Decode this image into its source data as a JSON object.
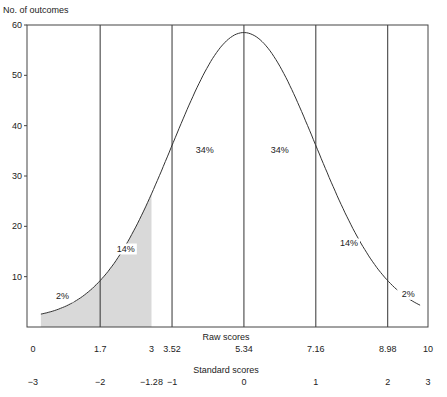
{
  "chart_data": {
    "type": "area",
    "title": "",
    "ylabel": "No. of outcomes",
    "xlabel_raw": "Raw scores",
    "xlabel_std": "Standard scores",
    "ylim": [
      0,
      60
    ],
    "yticks": [
      10,
      20,
      30,
      40,
      50,
      60
    ],
    "xlim": [
      0,
      10
    ],
    "raw_ticks": [
      {
        "value": 0,
        "label": "0"
      },
      {
        "value": 1.7,
        "label": "1.7"
      },
      {
        "value": 3,
        "label": "3"
      },
      {
        "value": 3.52,
        "label": "3.52"
      },
      {
        "value": 5.34,
        "label": "5.34"
      },
      {
        "value": 7.16,
        "label": "7.16"
      },
      {
        "value": 8.98,
        "label": "8.98"
      },
      {
        "value": 10,
        "label": "10"
      }
    ],
    "std_ticks": [
      {
        "value": 0,
        "label": "−3"
      },
      {
        "value": 1.7,
        "label": "−2"
      },
      {
        "value": 3,
        "label": "−1.28"
      },
      {
        "value": 3.52,
        "label": "−1"
      },
      {
        "value": 5.34,
        "label": "0"
      },
      {
        "value": 7.16,
        "label": "1"
      },
      {
        "value": 8.98,
        "label": "2"
      },
      {
        "value": 10,
        "label": "3"
      }
    ],
    "vertical_lines": [
      1.7,
      3.52,
      5.34,
      7.16,
      8.98
    ],
    "curve": {
      "mean": 5.34,
      "sd": 1.82,
      "peak": 58.5,
      "x_start": 0.2,
      "x_end": 9.8
    },
    "shaded_region": {
      "from": 0.2,
      "to": 3.0,
      "color": "#d9d9d9"
    },
    "annotations": [
      {
        "text": "2%",
        "x": 0.75,
        "y": 5.5
      },
      {
        "text": "14%",
        "x": 2.35,
        "y": 15
      },
      {
        "text": "34%",
        "x": 4.35,
        "y": 34.5
      },
      {
        "text": "34%",
        "x": 6.25,
        "y": 34.5
      },
      {
        "text": "14%",
        "x": 8.0,
        "y": 16
      },
      {
        "text": "2%",
        "x": 9.5,
        "y": 6
      }
    ],
    "grid": false,
    "legend": null
  }
}
